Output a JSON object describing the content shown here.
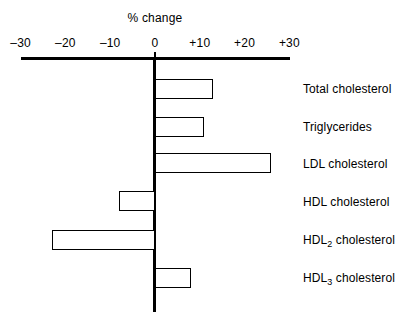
{
  "chart_data": {
    "type": "bar",
    "orientation": "horizontal",
    "title": "% change",
    "xlabel": "",
    "ylabel": "",
    "xlim": [
      -30,
      30
    ],
    "grid": false,
    "legend": null,
    "xticks": [
      -30,
      -20,
      -10,
      0,
      10,
      20,
      30
    ],
    "xtick_labels": [
      "–30",
      "–20",
      "–10",
      "0",
      "+10",
      "+20",
      "+30"
    ],
    "categories": [
      "Total cholesterol",
      "Triglycerides",
      "LDL cholesterol",
      "HDL cholesterol",
      "HDL2 cholesterol",
      "HDL3 cholesterol"
    ],
    "category_labels_html": [
      "Total cholesterol",
      "Triglycerides",
      "LDL cholesterol",
      "HDL cholesterol",
      "HDL<sub>2</sub> cholesterol",
      "HDL<sub>3</sub> cholesterol"
    ],
    "values": [
      13,
      11,
      26,
      -8,
      -23,
      8
    ],
    "bar_facecolor": "#ffffff",
    "bar_edgecolor": "#000000",
    "axis_color": "#000000"
  },
  "axis": {
    "ticks": [
      {
        "label": "–30",
        "value": -30
      },
      {
        "label": "–20",
        "value": -20
      },
      {
        "label": "–10",
        "value": -10
      },
      {
        "label": "0",
        "value": 0
      },
      {
        "label": "+10",
        "value": 10
      },
      {
        "label": "+20",
        "value": 20
      },
      {
        "label": "+30",
        "value": 30
      }
    ]
  },
  "header": {
    "title": "% change"
  }
}
